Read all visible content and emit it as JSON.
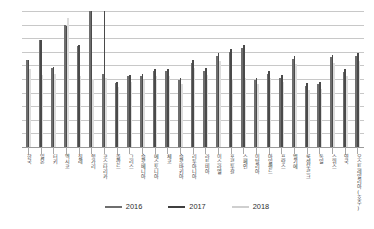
{
  "chart_data": {
    "type": "bar",
    "title": "",
    "subtitle": "",
    "xlabel": "",
    "ylabel": "",
    "ylim": [
      0,
      10
    ],
    "grid": true,
    "gridline_count": 10,
    "y_tick_labels": [],
    "legend_position": "bottom",
    "categories": [
      "한국",
      "일본",
      "터키",
      "멕시코",
      "칠레",
      "헝가리",
      "코스타리카",
      "폴란드",
      "그리스",
      "슬로베니아",
      "에스토니아",
      "체코",
      "슬로바키아",
      "리투아니아",
      "라트비아",
      "이스라엘",
      "포르투갈",
      "스페인",
      "이탈리아",
      "아일랜드",
      "프랑스",
      "벨기에",
      "룩셈부르크",
      "독일",
      "스위스",
      "영국",
      "오스트레일리아(호주)"
    ],
    "series": [
      {
        "name": "2016",
        "color": "#6e6e6e",
        "values": [
          6.4,
          7.9,
          5.8,
          9.0,
          7.4,
          10.0,
          5.4,
          4.7,
          5.2,
          5.2,
          5.6,
          5.6,
          4.9,
          6.2,
          5.6,
          6.7,
          7.0,
          7.3,
          4.9,
          5.4,
          5.1,
          6.5,
          4.5,
          4.6,
          6.6,
          5.5,
          6.7
        ]
      },
      {
        "name": "2017",
        "color": "#4a4a4a",
        "values": [
          6.4,
          7.9,
          5.9,
          8.9,
          7.5,
          10.2,
          10.4,
          4.8,
          5.3,
          5.4,
          5.7,
          5.7,
          5.1,
          6.4,
          5.8,
          6.9,
          7.2,
          7.5,
          5.1,
          5.6,
          5.3,
          6.7,
          4.7,
          4.8,
          6.8,
          5.7,
          6.9
        ]
      },
      {
        "name": "2018",
        "color": "#dcdcdc",
        "values": [
          5.7,
          5.3,
          5.4,
          9.5,
          5.2,
          5.0,
          5.1,
          4.4,
          4.8,
          4.9,
          5.2,
          5.2,
          4.6,
          5.8,
          5.3,
          6.3,
          5.0,
          5.1,
          4.6,
          5.1,
          4.8,
          6.1,
          4.2,
          4.3,
          6.2,
          5.2,
          6.3
        ]
      }
    ],
    "legend_entries": [
      {
        "label": "2016",
        "color": "#6e6e6e"
      },
      {
        "label": "2017",
        "color": "#4a4a4a"
      },
      {
        "label": "2018",
        "color": "#dcdcdc"
      }
    ]
  },
  "legend": {
    "items": [
      {
        "label": "2016"
      },
      {
        "label": "2017"
      },
      {
        "label": "2018"
      }
    ]
  }
}
